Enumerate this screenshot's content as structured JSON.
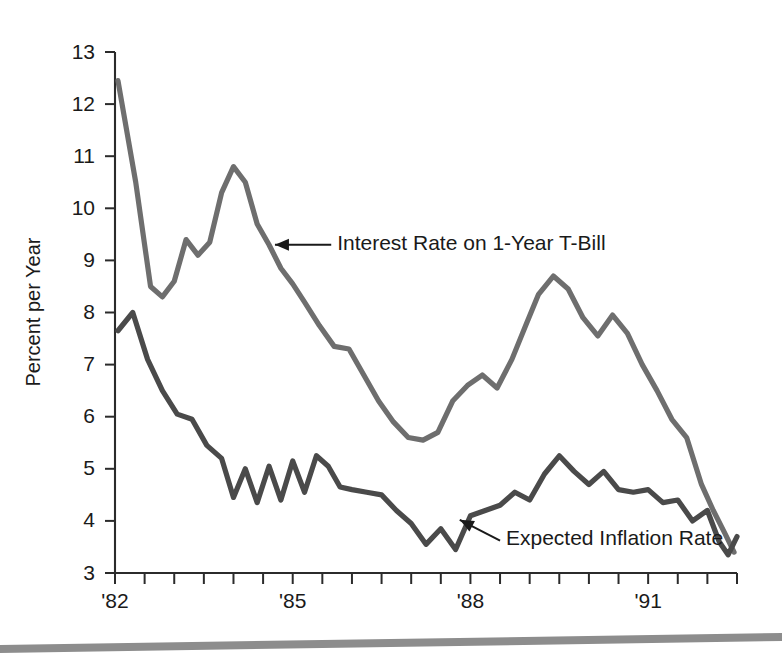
{
  "figure": {
    "background_color": "#ffffff",
    "page_rule_color": "#8d8d8d"
  },
  "chart_data": {
    "type": "line",
    "title": "",
    "subtitle": "",
    "xlabel": "",
    "ylabel": "Percent per Year",
    "xlim": [
      1982.0,
      1992.5
    ],
    "ylim": [
      3,
      13
    ],
    "grid": false,
    "legend_position": "inline-annotations",
    "y_ticks": [
      3,
      4,
      5,
      6,
      7,
      8,
      9,
      10,
      11,
      12,
      13
    ],
    "y_tick_labels": [
      "3",
      "4",
      "5",
      "6",
      "7",
      "8",
      "9",
      "10",
      "11",
      "12",
      "13"
    ],
    "x_ticks": [
      1982.0,
      1982.5,
      1983.0,
      1983.5,
      1984.0,
      1984.5,
      1985.0,
      1985.5,
      1986.0,
      1986.5,
      1987.0,
      1987.5,
      1988.0,
      1988.5,
      1989.0,
      1989.5,
      1990.0,
      1990.5,
      1991.0,
      1991.5,
      1992.0,
      1992.5
    ],
    "x_tick_labels_shown": [
      {
        "x": 1982.0,
        "label": "'82"
      },
      {
        "x": 1985.0,
        "label": "'85"
      },
      {
        "x": 1988.0,
        "label": "'88"
      },
      {
        "x": 1991.0,
        "label": "'91"
      }
    ],
    "series": [
      {
        "name": "Interest Rate on 1-Year T-Bill",
        "color": "#6e6e6e",
        "stroke_width": 5.2,
        "x": [
          1982.05,
          1982.35,
          1982.6,
          1982.8,
          1983.0,
          1983.2,
          1983.4,
          1983.6,
          1983.8,
          1984.0,
          1984.2,
          1984.4,
          1984.6,
          1984.8,
          1985.0,
          1985.2,
          1985.45,
          1985.7,
          1985.95,
          1986.2,
          1986.45,
          1986.7,
          1986.95,
          1987.2,
          1987.45,
          1987.7,
          1987.95,
          1988.2,
          1988.45,
          1988.7,
          1988.95,
          1989.15,
          1989.4,
          1989.65,
          1989.9,
          1990.15,
          1990.4,
          1990.65,
          1990.9,
          1991.15,
          1991.4,
          1991.65,
          1991.9,
          1992.1,
          1992.3,
          1992.45
        ],
        "y": [
          12.45,
          10.5,
          8.5,
          8.3,
          8.6,
          9.4,
          9.1,
          9.35,
          10.3,
          10.8,
          10.5,
          9.7,
          9.3,
          8.85,
          8.55,
          8.2,
          7.75,
          7.35,
          7.3,
          6.8,
          6.3,
          5.9,
          5.6,
          5.55,
          5.7,
          6.3,
          6.6,
          6.8,
          6.55,
          7.1,
          7.8,
          8.35,
          8.7,
          8.45,
          7.9,
          7.55,
          7.95,
          7.6,
          7.0,
          6.5,
          5.95,
          5.6,
          4.7,
          4.2,
          3.75,
          3.4
        ],
        "annotation": {
          "text": "Interest Rate on 1-Year T-Bill",
          "point_x": 1984.75,
          "point_y": 9.25
        }
      },
      {
        "name": "Expected Inflation Rate",
        "color": "#4a4a4a",
        "stroke_width": 5.2,
        "x": [
          1982.05,
          1982.3,
          1982.55,
          1982.8,
          1983.05,
          1983.3,
          1983.55,
          1983.8,
          1984.0,
          1984.2,
          1984.4,
          1984.6,
          1984.8,
          1985.0,
          1985.2,
          1985.4,
          1985.6,
          1985.8,
          1986.0,
          1986.25,
          1986.5,
          1986.75,
          1987.0,
          1987.25,
          1987.5,
          1987.75,
          1988.0,
          1988.25,
          1988.5,
          1988.75,
          1989.0,
          1989.25,
          1989.5,
          1989.75,
          1990.0,
          1990.25,
          1990.5,
          1990.75,
          1991.0,
          1991.25,
          1991.5,
          1991.75,
          1992.0,
          1992.2,
          1992.35,
          1992.5
        ],
        "y": [
          7.65,
          8.0,
          7.1,
          6.5,
          6.05,
          5.95,
          5.45,
          5.2,
          4.45,
          5.0,
          4.35,
          5.05,
          4.4,
          5.15,
          4.55,
          5.25,
          5.05,
          4.65,
          4.6,
          4.55,
          4.5,
          4.2,
          3.95,
          3.55,
          3.85,
          3.45,
          4.1,
          4.2,
          4.3,
          4.55,
          4.4,
          4.9,
          5.25,
          4.95,
          4.7,
          4.95,
          4.6,
          4.55,
          4.6,
          4.35,
          4.4,
          4.0,
          4.2,
          3.6,
          3.35,
          3.7
        ],
        "annotation": {
          "text": "Expected Inflation Rate",
          "point_x": 1987.75,
          "point_y": 4.05
        }
      }
    ],
    "annotations": [
      {
        "id": "interest-rate-callout",
        "text": "Interest Rate on 1-Year T-Bill",
        "text_x": 1985.75,
        "text_y": 9.3,
        "arrow_from_x": 1985.65,
        "arrow_from_y": 9.3,
        "arrow_to_x": 1984.7,
        "arrow_to_y": 9.3,
        "style": "horizontal-left-arrow"
      },
      {
        "id": "expected-inflation-callout",
        "text": "Expected Inflation Rate",
        "text_x": 1988.6,
        "text_y": 3.65,
        "arrow_from_x": 1988.5,
        "arrow_from_y": 3.62,
        "arrow_to_x": 1987.82,
        "arrow_to_y": 4.02,
        "style": "diagonal-upleft-arrow"
      }
    ]
  }
}
